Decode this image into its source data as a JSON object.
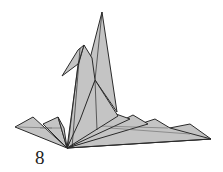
{
  "diagram": {
    "step_number": "8",
    "colors": {
      "paper": "#c4c4c4",
      "lines": "#2a2a2a",
      "background": "#ffffff"
    }
  }
}
